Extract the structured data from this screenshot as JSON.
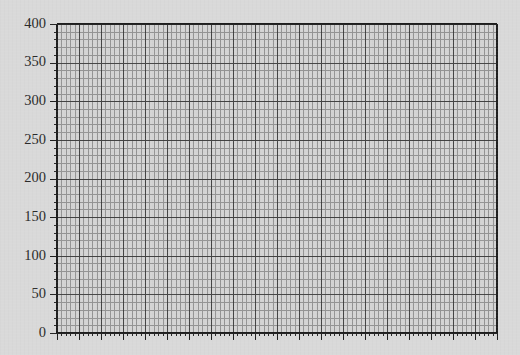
{
  "page": {
    "background_color": "#d9d9d9"
  },
  "chart_data": {
    "type": "line",
    "title": "",
    "subtitle": "",
    "xlabel": "",
    "ylabel": "",
    "series": [],
    "x": [],
    "values": [],
    "grid": true,
    "grid_minor": true,
    "legend": false,
    "legend_position": "none",
    "xlim": [
      0,
      20
    ],
    "ylim": [
      0,
      400
    ],
    "y_major_step": 50,
    "y_minor_per_major": 5,
    "x_major_step": 1,
    "x_minor_per_major": 5,
    "yticks": [
      0,
      50,
      100,
      150,
      200,
      250,
      300,
      350,
      400
    ],
    "ytick_labels": [
      "0",
      "50",
      "100",
      "150",
      "200",
      "250",
      "300",
      "350",
      "400"
    ],
    "xticks": [
      0,
      1,
      2,
      3,
      4,
      5,
      6,
      7,
      8,
      9,
      10,
      11,
      12,
      13,
      14,
      15,
      16,
      17,
      18,
      19,
      20
    ],
    "xtick_labels": [
      "",
      "",
      "",
      "",
      "",
      "",
      "",
      "",
      "",
      "",
      "",
      "",
      "",
      "",
      "",
      "",
      "",
      "",
      "",
      "",
      ""
    ],
    "colors": {
      "background": "#d9d9d9",
      "plot_background": "#d4d4d4",
      "major_grid": "#3c3c3c",
      "minor_grid": "#8a8a8a",
      "axis": "#1e1e1e",
      "tick_label": "#2b2b2b"
    }
  },
  "axes": {
    "y_axis_name": "y-axis",
    "x_axis_name": "x-axis",
    "plot_left_px": 57,
    "plot_top_px": 24,
    "plot_right_px": 497,
    "plot_bottom_px": 333
  }
}
